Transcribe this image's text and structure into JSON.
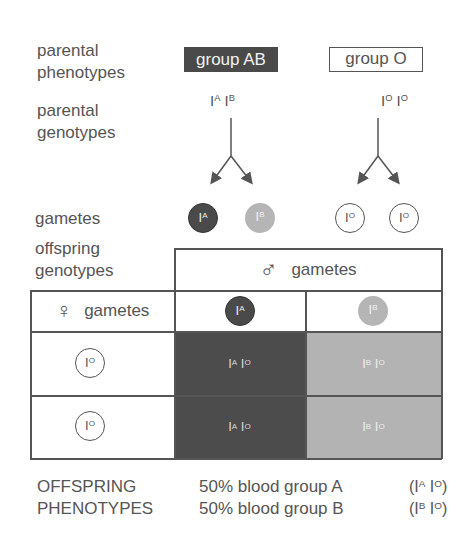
{
  "labels": {
    "parental_phenotypes": [
      "parental",
      "phenotypes"
    ],
    "parental_genotypes": [
      "parental",
      "genotypes"
    ],
    "gametes": "gametes",
    "offspring_genotypes": [
      "offspring",
      "genotypes"
    ]
  },
  "parents": {
    "left": {
      "phenotype": "group AB",
      "genotype": [
        {
          "base": "I",
          "sup": "A"
        },
        {
          "base": "I",
          "sup": "B"
        }
      ]
    },
    "right": {
      "phenotype": "group O",
      "genotype": [
        {
          "base": "I",
          "sup": "O"
        },
        {
          "base": "I",
          "sup": "O"
        }
      ]
    }
  },
  "gametes_row": [
    {
      "base": "I",
      "sup": "A",
      "style": "dark"
    },
    {
      "base": "I",
      "sup": "B",
      "style": "light"
    },
    {
      "base": "I",
      "sup": "O",
      "style": "open"
    },
    {
      "base": "I",
      "sup": "O",
      "style": "open"
    }
  ],
  "punnett": {
    "male_header": {
      "symbol": "♂",
      "label": "gametes"
    },
    "female_header": {
      "symbol": "♀",
      "label": "gametes"
    },
    "male_gametes": [
      {
        "base": "I",
        "sup": "A",
        "style": "dark"
      },
      {
        "base": "I",
        "sup": "B",
        "style": "light"
      }
    ],
    "female_gametes": [
      {
        "base": "I",
        "sup": "O",
        "style": "open"
      },
      {
        "base": "I",
        "sup": "O",
        "style": "open"
      }
    ],
    "cells": [
      [
        {
          "a": "A",
          "b": "O",
          "style": "dark"
        },
        {
          "a": "B",
          "b": "O",
          "style": "light"
        }
      ],
      [
        {
          "a": "A",
          "b": "O",
          "style": "dark"
        },
        {
          "a": "B",
          "b": "O",
          "style": "light"
        }
      ]
    ]
  },
  "results": {
    "heading": [
      "OFFSPRING",
      "PHENOTYPES"
    ],
    "rows": [
      {
        "text": "50% blood group A",
        "genotype_a": "A",
        "genotype_b": "O"
      },
      {
        "text": "50% blood group B",
        "genotype_a": "B",
        "genotype_b": "O"
      }
    ]
  },
  "colors": {
    "dark": "#4a4a4a",
    "light": "#b4b4b4",
    "line": "#555555"
  }
}
